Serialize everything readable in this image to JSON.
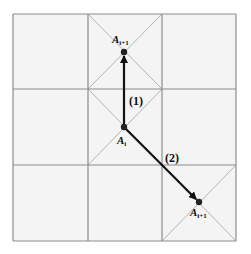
{
  "diagram": {
    "type": "grid-move-diagram",
    "grid": {
      "rows": 3,
      "cols": 3,
      "x_lines": [
        13,
        88,
        162,
        236
      ],
      "y_lines": [
        14,
        89,
        165,
        241
      ],
      "cell_fill": "#f4f4f4",
      "line_color": "#8c8c8c",
      "diagonal_color": "#b4b4b4",
      "crossed_cells": [
        {
          "row": 0,
          "col": 1
        },
        {
          "row": 1,
          "col": 1
        },
        {
          "row": 2,
          "col": 2
        }
      ]
    },
    "points": [
      {
        "id": "top",
        "x": 124,
        "y": 52,
        "label_base": "A",
        "label_sub": "i+1",
        "label_x": 112,
        "label_y": 43
      },
      {
        "id": "center",
        "x": 124,
        "y": 127,
        "label_base": "A",
        "label_sub": "i",
        "label_x": 117,
        "label_y": 144
      },
      {
        "id": "bottom-right",
        "x": 199,
        "y": 202,
        "label_base": "A",
        "label_sub": "i+1",
        "label_x": 190,
        "label_y": 216
      }
    ],
    "arrows": [
      {
        "id": "move-1",
        "from": "center",
        "to": "top",
        "label": "(1)",
        "label_x": 129,
        "label_y": 105
      },
      {
        "id": "move-2",
        "from": "center",
        "to": "bottom-right",
        "label": "(2)",
        "label_x": 165,
        "label_y": 162
      }
    ],
    "arrow_color": "#111111",
    "point_color": "#222222"
  }
}
